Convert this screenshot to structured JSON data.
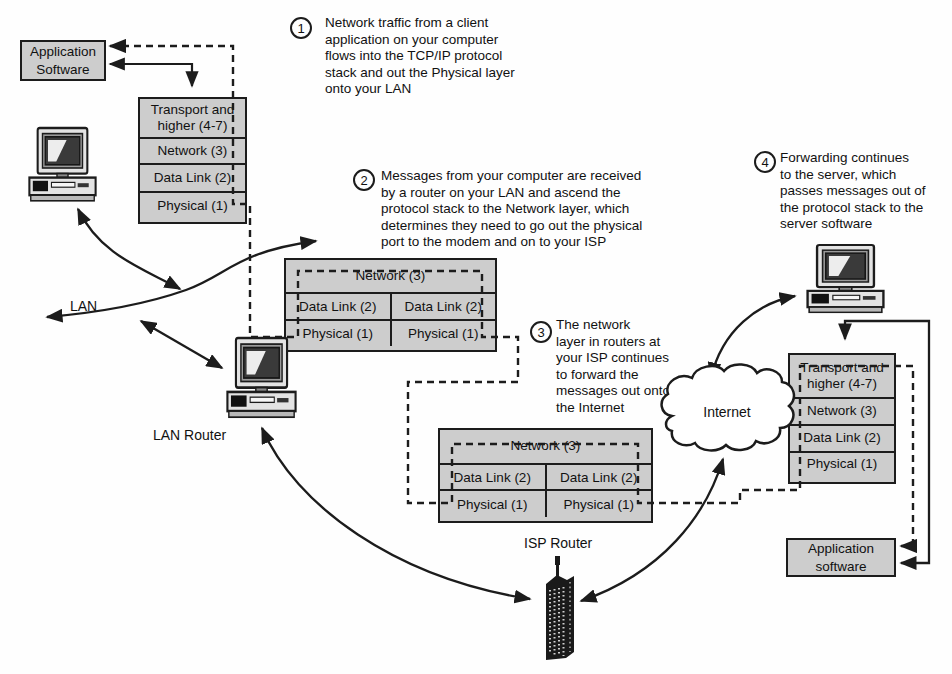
{
  "colors": {
    "box_fill": "#cdcdcd",
    "line": "#1c1c1c",
    "background": "#fefefe"
  },
  "boxes": {
    "app_software_top": "Application\nSoftware",
    "app_software_bottom": "Application\nsoftware"
  },
  "stacks": {
    "client": {
      "layers": [
        "Transport and\nhigher (4-7)",
        "Network (3)",
        "Data Link (2)",
        "Physical (1)"
      ]
    },
    "lan_router": {
      "network": "Network (3)",
      "cells": [
        "Data Link (2)",
        "Data Link (2)",
        "Physical (1)",
        "Physical (1)"
      ]
    },
    "isp_router": {
      "network": "Network (3)",
      "cells": [
        "Data Link (2)",
        "Data Link (2)",
        "Physical (1)",
        "Physical (1)"
      ]
    },
    "server": {
      "layers": [
        "Transport and\nhigher (4-7)",
        "Network (3)",
        "Data Link (2)",
        "Physical (1)"
      ]
    }
  },
  "labels": {
    "lan": "LAN",
    "lan_router": "LAN Router",
    "isp_router": "ISP Router",
    "internet": "Internet"
  },
  "annotations": [
    {
      "number": "1",
      "text": "Network traffic from a client\napplication on your computer\nflows into the TCP/IP protocol\nstack and out the Physical layer\nonto your LAN"
    },
    {
      "number": "2",
      "text": "Messages from your computer are received\nby a router on your LAN and ascend the\nprotocol stack to the Network layer, which\ndetermines they need to go out the physical\nport to the modem and on to your ISP"
    },
    {
      "number": "3",
      "text": "The network\nlayer in routers at\nyour ISP continues\nto forward the\nmessages out onto\nthe Internet"
    },
    {
      "number": "4",
      "text": "Forwarding continues\nto the server, which\npasses messages out of\nthe protocol stack to the\nserver software"
    }
  ]
}
